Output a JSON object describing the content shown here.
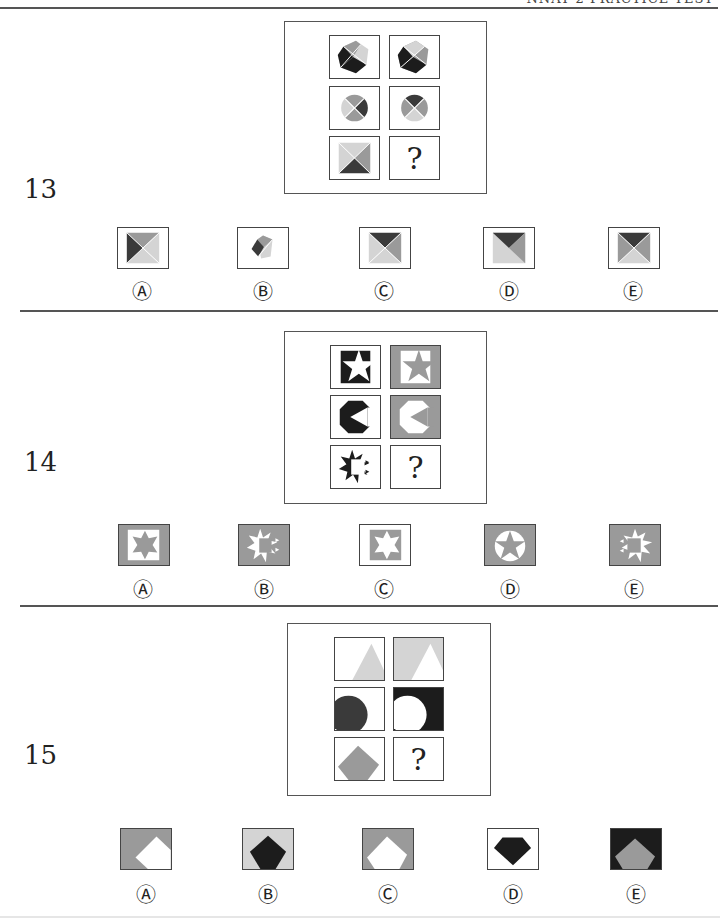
{
  "header": {
    "text": "NNAT 2 PRACTICE TEST"
  },
  "colors": {
    "black": "#1c1c1c",
    "dark": "#3a3a3a",
    "mid": "#9a9a9a",
    "light": "#d4d4d4",
    "white": "#ffffff",
    "border": "#444444"
  },
  "questions": [
    {
      "number": "13",
      "matrix": [
        [
          "hexagon-quartered-black-left",
          "hexagon-quartered-rotated"
        ],
        [
          "circle-quartered-dark-right",
          "circle-quartered-dark-top"
        ],
        [
          "square-quartered-dark-bottom",
          "?"
        ]
      ],
      "options": [
        {
          "label": "Ⓐ",
          "shape": "square-quartered-dark-left"
        },
        {
          "label": "Ⓑ",
          "shape": "small-pentagon-quartered"
        },
        {
          "label": "Ⓒ",
          "shape": "square-quartered-dark-top"
        },
        {
          "label": "Ⓓ",
          "shape": "square-halved-dark-top"
        },
        {
          "label": "Ⓔ",
          "shape": "square-quartered-dark-top-mid-sides"
        }
      ]
    },
    {
      "number": "14",
      "matrix": [
        [
          "white-star-on-black",
          "gray-star-on-white-in-gray"
        ],
        [
          "black-octagon-white-notch",
          "white-octagon-gray-notch-in-gray"
        ],
        [
          "black-burst-split",
          "?"
        ]
      ],
      "options": [
        {
          "label": "Ⓐ",
          "shape": "gray-star-white-square-gray-bg"
        },
        {
          "label": "Ⓑ",
          "shape": "white-burst-split-gray-bg"
        },
        {
          "label": "Ⓒ",
          "shape": "white-star-gray-square-white-bg"
        },
        {
          "label": "Ⓓ",
          "shape": "gray-star-white-circle-gray-bg"
        },
        {
          "label": "Ⓔ",
          "shape": "white-burst-split-gray-bg-alt"
        }
      ]
    },
    {
      "number": "15",
      "matrix": [
        [
          "light-triangle-on-white",
          "white-triangle-on-light"
        ],
        [
          "dark-circle-on-white",
          "white-circle-on-dark"
        ],
        [
          "gray-diamond-on-white",
          "?"
        ]
      ],
      "options": [
        {
          "label": "Ⓐ",
          "shape": "white-diamond-offset-gray-bg"
        },
        {
          "label": "Ⓑ",
          "shape": "dark-diamond-light-bg"
        },
        {
          "label": "Ⓒ",
          "shape": "white-diamond-gray-bg"
        },
        {
          "label": "Ⓓ",
          "shape": "dark-gem-white-bg"
        },
        {
          "label": "Ⓔ",
          "shape": "gray-diamond-black-bg"
        }
      ]
    }
  ],
  "question_mark": "?"
}
